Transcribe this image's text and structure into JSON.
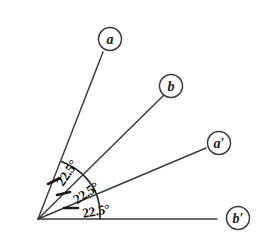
{
  "figure": {
    "background_color": "#ffffff",
    "line_color": "#3a3a3a",
    "text_color": "#141414",
    "vertex": {
      "x": 38,
      "y": 219
    },
    "arc_radius": 62
  },
  "rays": [
    {
      "id": "ray-a",
      "label": "a",
      "angle_deg": 67.5,
      "end_x": 103,
      "end_y": 52,
      "label_circle": {
        "cx": 110,
        "cy": 39,
        "r": 11.5
      }
    },
    {
      "id": "ray-b",
      "label": "b",
      "angle_deg": 45,
      "end_x": 164,
      "end_y": 95,
      "label_circle": {
        "cx": 171,
        "cy": 86,
        "r": 11.5
      }
    },
    {
      "id": "ray-a-prime",
      "label": "a′",
      "angle_deg": 22.5,
      "end_x": 206,
      "end_y": 148,
      "label_circle": {
        "cx": 219,
        "cy": 143,
        "r": 11.5
      }
    },
    {
      "id": "ray-b-prime",
      "label": "b′",
      "angle_deg": 0,
      "end_x": 217,
      "end_y": 219,
      "label_circle": {
        "cx": 238,
        "cy": 218,
        "r": 11.5
      }
    }
  ],
  "angle_labels": [
    {
      "id": "angle-a-b",
      "value": "22.5°",
      "between": [
        "a",
        "b"
      ],
      "x": 67,
      "y": 173,
      "rotation_deg": -56
    },
    {
      "id": "angle-b-a-prime",
      "value": "22.5°",
      "between": [
        "b",
        "a′"
      ],
      "x": 84,
      "y": 192,
      "rotation_deg": -34
    },
    {
      "id": "angle-a-prime-b-prime",
      "value": "22.5°",
      "between": [
        "a′",
        "b′"
      ],
      "x": 94,
      "y": 211,
      "rotation_deg": -10
    }
  ],
  "tick_marks": [
    {
      "id": "tick-1",
      "x1": 48,
      "y1": 184,
      "x2": 60,
      "y2": 178
    },
    {
      "id": "tick-2",
      "x1": 57,
      "y1": 194,
      "x2": 70,
      "y2": 192
    },
    {
      "id": "tick-3",
      "x1": 64,
      "y1": 208,
      "x2": 78,
      "y2": 208
    }
  ]
}
